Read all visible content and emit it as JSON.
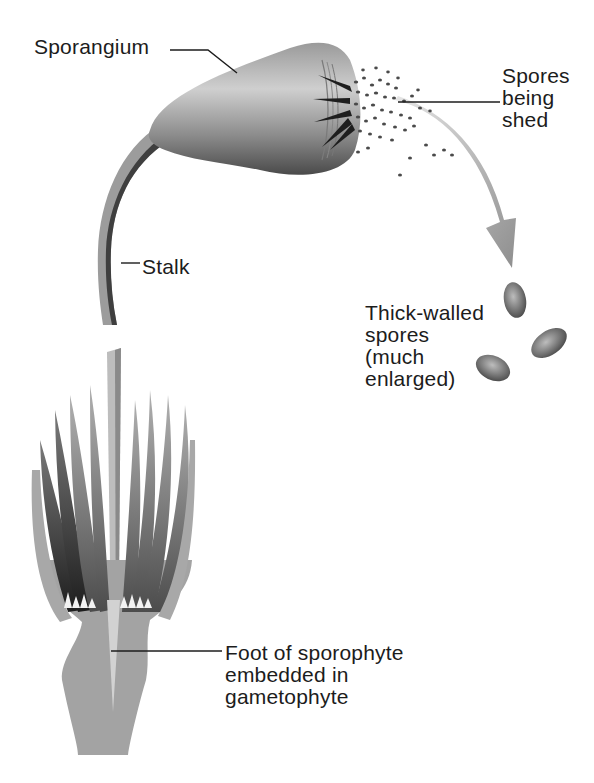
{
  "figure": {
    "type": "biology-illustration"
  },
  "labels": {
    "sporangium": "Sporangium",
    "spores_being_shed": "Spores\nbeing\nshed",
    "stalk": "Stalk",
    "thick_walled_spores": "Thick-walled\nspores\n(much\nenlarged)",
    "foot": "Foot of sporophyte\nembedded in\ngametophyte"
  },
  "colors": {
    "background": "#ffffff",
    "text": "#1c1c1c",
    "sporangium_light": "#c4c4c4",
    "sporangium_dark": "#5a5a5a",
    "arrow": "#a8a8a8",
    "gametophyte": "#a3a3a3",
    "leaf_dark": "#2e2e2e",
    "spore": "#555555"
  }
}
